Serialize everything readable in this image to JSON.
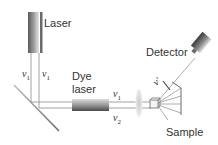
{
  "diagram": {
    "components": {
      "laser": {
        "label": "Laser"
      },
      "dye_laser": {
        "label_line1": "Dye",
        "label_line2": "laser"
      },
      "detector": {
        "label": "Detector"
      },
      "sample": {
        "label": "Sample"
      },
      "mirror": {
        "label": ""
      },
      "lens": {
        "label": ""
      }
    },
    "beam_labels": {
      "laser_left": {
        "symbol": "ν",
        "subscript": "1"
      },
      "laser_right": {
        "symbol": "ν",
        "subscript": "1"
      },
      "upper_horizontal": {
        "symbol": "ν",
        "subscript": "1"
      },
      "lower_horizontal": {
        "symbol": "ν",
        "subscript": "2"
      },
      "scattered": {
        "symbol": "ν′",
        "subscript": ""
      }
    },
    "colors": {
      "line": "#8a8a8a",
      "text": "#333333",
      "laser_dark": "#555555",
      "laser_light": "#d9d9d9",
      "lens": "#cfcfcf"
    }
  }
}
